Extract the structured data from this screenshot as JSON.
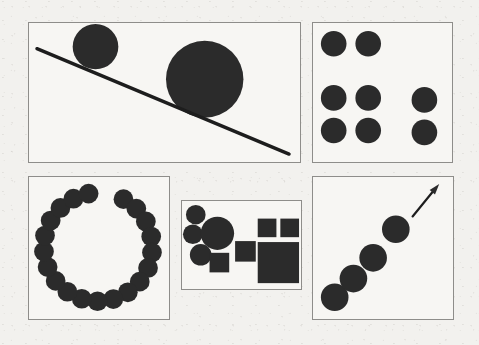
{
  "figure": {
    "width": 479,
    "height": 345,
    "background_color": "#f2f1ee",
    "ink_color": "#2b2b2b",
    "border_color": "#8e8d8a",
    "panel_background": "#f7f6f3"
  },
  "panels": [
    {
      "id": "panel-line-and-circles",
      "name": "line-with-two-circles",
      "caption": "",
      "x": 28,
      "y": 22,
      "width": 273,
      "height": 141,
      "elements": {
        "line": {
          "x1": 8,
          "y1": 26,
          "x2": 262,
          "y2": 133,
          "stroke_width": 3.4
        },
        "circles": [
          {
            "cx": 67,
            "cy": 24,
            "r": 23
          },
          {
            "cx": 177,
            "cy": 57,
            "r": 39
          }
        ]
      }
    },
    {
      "id": "panel-circle-grid",
      "name": "grid-of-seven-circles",
      "caption": "",
      "x": 312,
      "y": 22,
      "width": 141,
      "height": 141,
      "elements": {
        "circles": [
          {
            "cx": 21,
            "cy": 21,
            "r": 13
          },
          {
            "cx": 56,
            "cy": 21,
            "r": 13
          },
          {
            "cx": 21,
            "cy": 76,
            "r": 13
          },
          {
            "cx": 56,
            "cy": 76,
            "r": 13
          },
          {
            "cx": 113,
            "cy": 78,
            "r": 13
          },
          {
            "cx": 21,
            "cy": 109,
            "r": 13
          },
          {
            "cx": 56,
            "cy": 109,
            "r": 13
          },
          {
            "cx": 113,
            "cy": 111,
            "r": 13
          }
        ]
      }
    },
    {
      "id": "panel-circle-ring",
      "name": "ring-of-circles",
      "caption": "",
      "x": 28,
      "y": 176,
      "width": 142,
      "height": 144,
      "elements": {
        "ring": {
          "center_x": 70,
          "center_y": 71,
          "ring_radius": 55,
          "dot_radius": 10,
          "count": 20,
          "start_angle_deg": -62,
          "sweep_deg": 322
        }
      }
    },
    {
      "id": "panel-circles-and-squares",
      "name": "circles-versus-squares",
      "caption": "",
      "x": 181,
      "y": 200,
      "width": 121,
      "height": 90,
      "elements": {
        "circles": [
          {
            "cx": 14,
            "cy": 14,
            "r": 10
          },
          {
            "cx": 11,
            "cy": 34,
            "r": 10
          },
          {
            "cx": 19,
            "cy": 55,
            "r": 11
          },
          {
            "cx": 36,
            "cy": 33,
            "r": 17
          }
        ],
        "squares": [
          {
            "x": 28,
            "y": 53,
            "width": 20,
            "height": 20
          },
          {
            "x": 54,
            "y": 41,
            "width": 21,
            "height": 21
          },
          {
            "x": 77,
            "y": 18,
            "width": 19,
            "height": 19
          },
          {
            "x": 100,
            "y": 18,
            "width": 19,
            "height": 19
          },
          {
            "x": 77,
            "y": 42,
            "width": 42,
            "height": 42
          }
        ]
      }
    },
    {
      "id": "panel-circles-with-arrow",
      "name": "diagonal-circles-with-arrow",
      "caption": "",
      "x": 312,
      "y": 176,
      "width": 142,
      "height": 144,
      "elements": {
        "circles": [
          {
            "cx": 22,
            "cy": 122,
            "r": 14
          },
          {
            "cx": 41,
            "cy": 103,
            "r": 14
          },
          {
            "cx": 61,
            "cy": 82,
            "r": 14
          },
          {
            "cx": 84,
            "cy": 53,
            "r": 14
          }
        ],
        "arrow": {
          "x1": 101,
          "y1": 40,
          "x2": 128,
          "y2": 7,
          "stroke_width": 2.2,
          "head_length": 11,
          "head_width": 7
        }
      }
    }
  ]
}
